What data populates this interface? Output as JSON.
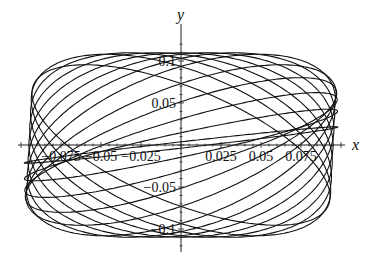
{
  "chart_data": {
    "type": "line",
    "title": "",
    "xlabel": "x",
    "ylabel": "y",
    "xlim": [
      -0.1,
      0.1
    ],
    "ylim": [
      -0.12,
      0.12
    ],
    "x_ticks": [
      -0.075,
      -0.05,
      -0.025,
      0.025,
      0.05,
      0.075
    ],
    "x_tick_labels": [
      "−0.075",
      "−0.05",
      "−0.025",
      "0.025",
      "0.05",
      "0.075"
    ],
    "y_ticks": [
      0.1,
      0.05,
      -0.05,
      -0.1
    ],
    "y_tick_labels": [
      "0.1",
      "0.05",
      "−0.05",
      "−0.1"
    ],
    "grid": false,
    "legend": null,
    "series": [
      {
        "name": "curve family",
        "amplitude_x": 0.098,
        "amplitude_y": 0.105,
        "phases_deg": [
          10,
          20,
          30,
          40,
          50,
          60,
          70,
          80,
          90,
          100,
          110,
          120,
          130
        ]
      }
    ]
  },
  "axes": {
    "x_label": "x",
    "y_label": "y"
  }
}
